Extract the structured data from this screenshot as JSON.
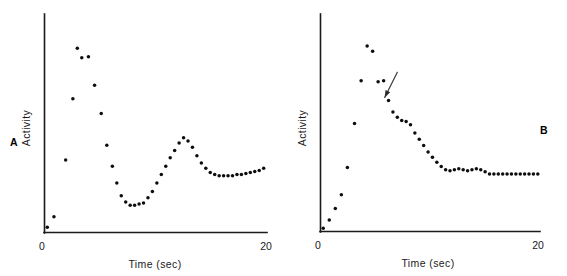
{
  "figure": {
    "background": "#ffffff",
    "point_color": "#0d0d0d",
    "axis_color": "#1a1a1a"
  },
  "chart_data": [
    {
      "type": "scatter",
      "panel_label": "A",
      "title": "",
      "xlabel": "Time (sec)",
      "ylabel": "Activity",
      "xlim": [
        0,
        20
      ],
      "ylim": [
        0,
        100
      ],
      "xticks": [
        0,
        20
      ],
      "xticklabels": [
        "0",
        "20"
      ],
      "yticks": [],
      "yticklabels": [],
      "grid": false,
      "legend": "none",
      "annotations": [],
      "x": [
        0.25,
        0.85,
        1.9,
        2.55,
        2.95,
        3.35,
        3.95,
        4.5,
        5.1,
        5.6,
        6.1,
        6.5,
        6.9,
        7.3,
        7.7,
        8.1,
        8.5,
        8.9,
        9.3,
        9.7,
        10.1,
        10.5,
        10.9,
        11.3,
        11.7,
        12.1,
        12.5,
        12.9,
        13.3,
        13.7,
        14.1,
        14.5,
        14.9,
        15.3,
        15.7,
        16.1,
        16.5,
        16.9,
        17.3,
        17.7,
        18.1,
        18.5,
        18.9,
        19.3,
        19.7
      ],
      "y": [
        2.5,
        7.5,
        34.5,
        63.5,
        87.5,
        83.0,
        83.5,
        70.0,
        56.5,
        41.5,
        31.5,
        23.5,
        17.5,
        14.5,
        13.0,
        13.0,
        13.5,
        14.0,
        16.5,
        19.5,
        23.5,
        27.5,
        31.5,
        35.5,
        39.0,
        42.5,
        45.0,
        43.5,
        40.5,
        36.5,
        33.0,
        30.5,
        28.5,
        27.5,
        27.0,
        27.0,
        27.0,
        27.0,
        27.5,
        27.5,
        28.0,
        28.5,
        29.0,
        29.5,
        30.5
      ]
    },
    {
      "type": "scatter",
      "panel_label": "B",
      "title": "",
      "xlabel": "Time (sec)",
      "ylabel": "Activity",
      "xlim": [
        0,
        20
      ],
      "ylim": [
        0,
        100
      ],
      "xticks": [
        0,
        20
      ],
      "xticklabels": [
        "0",
        "20"
      ],
      "yticks": [],
      "yticklabels": [],
      "grid": false,
      "legend": "none",
      "annotations": [
        {
          "kind": "arrow",
          "text": "",
          "tail_x": 7.0,
          "tail_y": 76.0,
          "tip_x": 5.85,
          "tip_y": 64.0
        }
      ],
      "x": [
        0.25,
        0.8,
        1.35,
        1.9,
        2.45,
        3.1,
        3.7,
        4.25,
        4.75,
        5.25,
        5.75,
        6.2,
        6.6,
        7.0,
        7.4,
        7.8,
        8.2,
        8.6,
        9.0,
        9.4,
        9.8,
        10.2,
        10.6,
        11.0,
        11.4,
        11.8,
        12.2,
        12.6,
        13.0,
        13.4,
        13.8,
        14.2,
        14.6,
        15.0,
        15.4,
        15.8,
        16.2,
        16.6,
        17.0,
        17.4,
        17.8,
        18.2,
        18.6,
        19.0,
        19.4,
        19.8
      ],
      "y": [
        1.5,
        5.5,
        11.0,
        17.5,
        30.5,
        51.5,
        72.0,
        88.5,
        86.0,
        71.5,
        72.0,
        62.5,
        57.0,
        54.5,
        53.0,
        52.5,
        51.0,
        47.0,
        44.0,
        41.0,
        38.0,
        35.5,
        33.0,
        31.0,
        29.5,
        29.0,
        29.5,
        30.0,
        29.5,
        29.0,
        29.5,
        30.0,
        29.5,
        28.5,
        27.5,
        27.5,
        27.5,
        27.5,
        27.5,
        27.5,
        27.5,
        27.5,
        27.5,
        27.5,
        27.5,
        27.5
      ]
    }
  ]
}
